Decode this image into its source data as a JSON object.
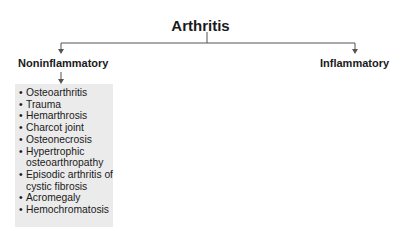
{
  "title": "Arthritis",
  "branches": [
    {
      "label": "Noninflammatory",
      "items": [
        "Osteoarthritis",
        "Trauma",
        "Hemarthrosis",
        "Charcot joint",
        "Osteonecrosis",
        "Hypertrophic osteoarthropathy",
        "Episodic arthritis of cystic fibrosis",
        "Acromegaly",
        "Hemochromatosis"
      ]
    },
    {
      "label": "Inflammatory"
    }
  ],
  "bullet": "•",
  "colors": {
    "line": "#555555",
    "box": "#ebebeb",
    "text": "#1a1a1a"
  }
}
